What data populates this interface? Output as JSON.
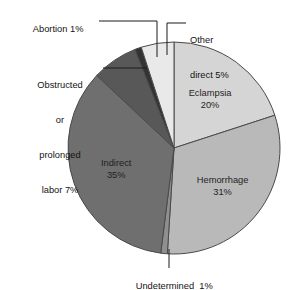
{
  "chart_data": {
    "type": "pie",
    "title": "",
    "subtitle": "",
    "xlabel": "",
    "ylabel": "",
    "legend_position": "none",
    "grid": false,
    "units": "percent",
    "start_angle_deg": 0,
    "direction": "clockwise",
    "categories": [
      "Eclampsia",
      "Hemorrhage",
      "Undetermined",
      "Indirect",
      "Obstructed or prolonged labor",
      "Abortion",
      "Other direct"
    ],
    "values": [
      20,
      31,
      1,
      35,
      7,
      1,
      5
    ],
    "slices": [
      {
        "name": "Eclampsia",
        "value": 20,
        "label_lines": [
          "Eclampsia",
          "20%"
        ],
        "color": "#d5d5d5",
        "label_mode": "inside"
      },
      {
        "name": "Hemorrhage",
        "value": 31,
        "label_lines": [
          "Hemorrhage",
          "31%"
        ],
        "color": "#b9b9b9",
        "label_mode": "inside"
      },
      {
        "name": "Undetermined",
        "value": 1,
        "label_lines": [
          "Undetermined  1%"
        ],
        "color": "#8f8f8f",
        "label_mode": "callout"
      },
      {
        "name": "Indirect",
        "value": 35,
        "label_lines": [
          "Indirect",
          "35%"
        ],
        "color": "#6f6f6f",
        "label_mode": "inside"
      },
      {
        "name": "Obstructed or prolonged labor",
        "value": 7,
        "label_lines": [
          "Obstructed",
          "or",
          "prolonged",
          "labor 7%"
        ],
        "color": "#585858",
        "label_mode": "callout"
      },
      {
        "name": "Abortion",
        "value": 1,
        "label_lines": [
          "Abortion 1%"
        ],
        "color": "#333333",
        "label_mode": "callout"
      },
      {
        "name": "Other direct",
        "value": 5,
        "label_lines": [
          "Other",
          "direct 5%"
        ],
        "color": "#e9e9e9",
        "label_mode": "callout"
      }
    ]
  },
  "labels": {
    "eclampsia_line1": "Eclampsia",
    "eclampsia_line2": "20%",
    "hemorrhage_line1": "Hemorrhage",
    "hemorrhage_line2": "31%",
    "indirect_line1": "Indirect",
    "indirect_line2": "35%",
    "abortion": "Abortion 1%",
    "obstructed_line1": "Obstructed",
    "obstructed_line2": "or",
    "obstructed_line3": "prolonged",
    "obstructed_line4": "labor 7%",
    "other_direct_line1": "Other",
    "other_direct_line2": "direct 5%",
    "undetermined": "Undetermined  1%"
  },
  "colors": {
    "other_direct": "#e9e9e9",
    "eclampsia": "#d5d5d5",
    "hemorrhage": "#b9b9b9",
    "undetermined": "#8f8f8f",
    "indirect": "#6f6f6f",
    "obstructed": "#585858",
    "abortion": "#333333",
    "outline": "#4a4a4a",
    "text": "#141414"
  }
}
